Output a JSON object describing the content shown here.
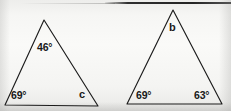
{
  "figure": {
    "background_color": "#f4f4f2",
    "stroke_color": "#1c1c1c",
    "label_color": "#181818",
    "degree_symbol": "°"
  },
  "triangles": [
    {
      "id": "left-triangle",
      "name": "triangle-1",
      "vertices": {
        "apex": {
          "x": 44,
          "y": 20
        },
        "bottom_left": {
          "x": 5,
          "y": 105
        },
        "bottom_right": {
          "x": 98,
          "y": 106
        }
      },
      "labels": [
        {
          "id": "apex-angle",
          "name": "angle-label-46",
          "text": "46°",
          "x": 37,
          "y": 42,
          "kind": "known"
        },
        {
          "id": "bottom-left-angle",
          "name": "angle-label-69-left",
          "text": "69°",
          "x": 11,
          "y": 90,
          "kind": "known"
        },
        {
          "id": "bottom-right-angle",
          "name": "angle-label-c",
          "text": "c",
          "x": 79,
          "y": 89,
          "kind": "unknown"
        }
      ]
    },
    {
      "id": "right-triangle",
      "name": "triangle-2",
      "vertices": {
        "apex": {
          "x": 173,
          "y": 10
        },
        "bottom_left": {
          "x": 127,
          "y": 104
        },
        "bottom_right": {
          "x": 222,
          "y": 104
        }
      },
      "labels": [
        {
          "id": "apex-angle",
          "name": "angle-label-b",
          "text": "b",
          "x": 169,
          "y": 22,
          "kind": "unknown"
        },
        {
          "id": "bottom-left-angle",
          "name": "angle-label-69-right",
          "text": "69°",
          "x": 136,
          "y": 90,
          "kind": "known"
        },
        {
          "id": "bottom-right-angle",
          "name": "angle-label-63",
          "text": "63°",
          "x": 194,
          "y": 90,
          "kind": "known"
        }
      ]
    }
  ],
  "labels_flat": {
    "t1_apex": "46°",
    "t1_bottom_left": "69°",
    "t1_bottom_right": "c",
    "t2_apex": "b",
    "t2_bottom_left": "69°",
    "t2_bottom_right": "63°"
  }
}
